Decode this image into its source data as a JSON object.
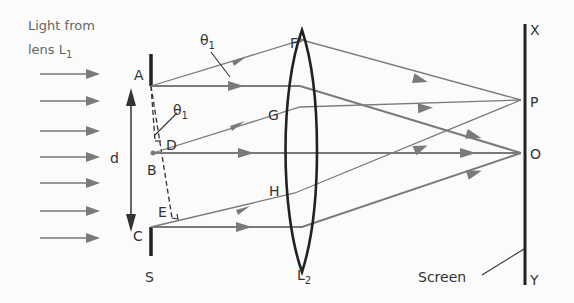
{
  "caption": {
    "line1": "Light from",
    "line2": "lens L",
    "line2_sub": "1"
  },
  "points": {
    "A": "A",
    "B": "B",
    "C": "C",
    "D": "D",
    "E": "E",
    "F": "F",
    "G": "G",
    "H": "H",
    "P": "P",
    "O": "O",
    "X": "X",
    "Y": "Y",
    "S": "S"
  },
  "angle": {
    "theta": "θ",
    "sub": "1"
  },
  "distance": "d",
  "lens": {
    "name": "L",
    "sub": "2"
  },
  "screen_label": "Screen",
  "colors": {
    "ray": "#7a7a7a",
    "solid": "#222222",
    "text": "#333333"
  }
}
